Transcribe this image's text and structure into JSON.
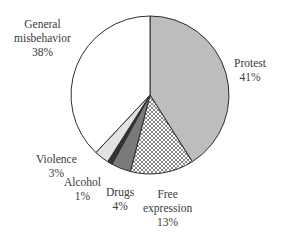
{
  "chart_data": {
    "type": "pie",
    "title": "",
    "start_angle_deg": 0,
    "direction": "clockwise",
    "categories": [
      "Protest",
      "Free expression",
      "Drugs",
      "Alcohol",
      "Violence",
      "General misbehavior"
    ],
    "values": [
      41,
      13,
      4,
      1,
      3,
      38
    ],
    "unit": "%",
    "slices": [
      {
        "name": "Protest",
        "value": 41,
        "label": "Protest",
        "pct": "41%",
        "fill": "#bdbdbd",
        "pattern": "solid"
      },
      {
        "name": "Free expression",
        "value": 13,
        "label": "Free expression",
        "pct": "13%",
        "fill": "#ffffff",
        "pattern": "crosshatch"
      },
      {
        "name": "Drugs",
        "value": 4,
        "label": "Drugs",
        "pct": "4%",
        "fill": "#7a7a7a",
        "pattern": "solid"
      },
      {
        "name": "Alcohol",
        "value": 1,
        "label": "Alcohol",
        "pct": "1%",
        "fill": "#333333",
        "pattern": "solid"
      },
      {
        "name": "Violence",
        "value": 3,
        "label": "Violence",
        "pct": "3%",
        "fill": "#e2e2e2",
        "pattern": "solid"
      },
      {
        "name": "General misbehavior",
        "value": 38,
        "label": "General misbehavior",
        "pct": "38%",
        "fill": "#ffffff",
        "pattern": "solid"
      }
    ],
    "legend": "none (direct labels)",
    "geometry": {
      "cx": 150,
      "cy": 95,
      "r": 79
    }
  },
  "labels": {
    "protest": {
      "line1": "Protest",
      "line2": "41%"
    },
    "free_expression": {
      "line1": "Free",
      "line2": "expression",
      "line3": "13%"
    },
    "drugs": {
      "line1": "Drugs",
      "line2": "4%"
    },
    "alcohol": {
      "line1": "Alcohol",
      "line2": "1%"
    },
    "violence": {
      "line1": "Violence",
      "line2": "3%"
    },
    "general": {
      "line1": "General",
      "line2": "misbehavior",
      "line3": "38%"
    }
  }
}
